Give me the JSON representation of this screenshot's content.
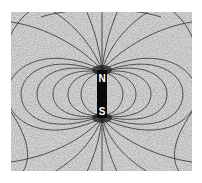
{
  "image": {
    "description": "Iron filings photograph showing magnetic field lines around a vertical bar magnet",
    "background_color": "#d4d4d4",
    "line_color": "#2a2a2a",
    "magnet_color": "#0a0a0a"
  },
  "magnet": {
    "north_label": "N",
    "south_label": "S"
  }
}
